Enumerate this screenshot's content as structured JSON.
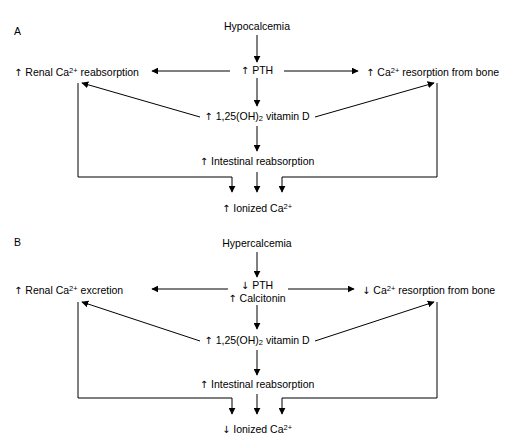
{
  "figure": {
    "title_hidden": "",
    "background": "#ffffff",
    "line_color": "#000000"
  },
  "panels": [
    {
      "id": "A",
      "label": "A",
      "nodes": {
        "trigger": {
          "text": "Hypocalcemia",
          "arrow": ""
        },
        "hormone1": {
          "text": "PTH",
          "arrow": "↑"
        },
        "hormone2": {
          "text": "",
          "arrow": ""
        },
        "left": {
          "text": "Renal Ca",
          "sup": "2+",
          "tail": " reabsorption",
          "arrow": "↑"
        },
        "right": {
          "text": "Ca",
          "sup": "2+",
          "tail": " resorption from bone",
          "arrow": "↑"
        },
        "vitamind": {
          "text": "1,25(OH)",
          "sub": "2",
          "tail": " vitamin D",
          "arrow": "↑"
        },
        "intestinal": {
          "text": "Intestinal reabsorption",
          "arrow": "↑"
        },
        "outcome": {
          "text": "Ionized Ca",
          "sup": "2+",
          "tail": "",
          "arrow": "↑"
        }
      }
    },
    {
      "id": "B",
      "label": "B",
      "nodes": {
        "trigger": {
          "text": "Hypercalcemia",
          "arrow": ""
        },
        "hormone1": {
          "text": "PTH",
          "arrow": "↓"
        },
        "hormone2": {
          "text": "Calcitonin",
          "arrow": "↑"
        },
        "left": {
          "text": "Renal Ca",
          "sup": "2+",
          "tail": " excretion",
          "arrow": "↑"
        },
        "right": {
          "text": "Ca",
          "sup": "2+",
          "tail": " resorption from bone",
          "arrow": "↓"
        },
        "vitamind": {
          "text": "1,25(OH)",
          "sub": "2",
          "tail": " vitamin D",
          "arrow": "↑"
        },
        "intestinal": {
          "text": "Intestinal reabsorption",
          "arrow": "↑"
        },
        "outcome": {
          "text": "Ionized Ca",
          "sup": "2+",
          "tail": "",
          "arrow": "↓"
        }
      }
    }
  ]
}
